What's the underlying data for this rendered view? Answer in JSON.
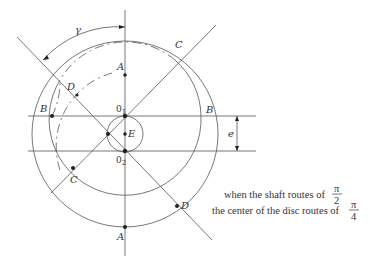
{
  "diagram": {
    "points": {
      "A_top": "A",
      "A_bottom": "A",
      "B_left": "B",
      "B_right": "B",
      "C_left": "C",
      "C_right": "C",
      "D_left": "D",
      "D_right": "D",
      "E": "E",
      "O1": "0",
      "O1_sub": "1",
      "O2": "0",
      "O2_sub": "2"
    },
    "angle_label": "γ",
    "offset_label": "e",
    "caption": {
      "line1": "when the shaft routes of",
      "line1_frac_num": "π",
      "line1_frac_den": "2",
      "line2": "the center of the disc routes of",
      "line2_frac_num": "π",
      "line2_frac_den": "4"
    },
    "colors": {
      "line": "#555555",
      "point": "#222222",
      "text": "#333333"
    }
  }
}
